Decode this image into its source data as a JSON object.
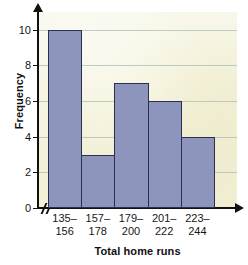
{
  "chart_data": {
    "type": "bar",
    "title": "",
    "xlabel": "Total home runs",
    "ylabel": "Frequency",
    "categories": [
      "135–156",
      "157–178",
      "179–200",
      "201–222",
      "223–244"
    ],
    "category_lines": [
      [
        "135–",
        "156"
      ],
      [
        "157–",
        "178"
      ],
      [
        "179–",
        "200"
      ],
      [
        "201–",
        "222"
      ],
      [
        "223–",
        "244"
      ]
    ],
    "values": [
      10,
      3,
      7,
      6,
      4
    ],
    "ylim": [
      0,
      11
    ],
    "yticks": [
      0,
      2,
      4,
      6,
      8,
      10
    ],
    "ytick_labels": [
      "0",
      "2",
      "4",
      "6",
      "8",
      "10"
    ],
    "grid": true,
    "grid_axis": "y",
    "legend": false,
    "bar_gap": 0,
    "axis_break_x": true,
    "colors": {
      "bar_fill": "#8d95bd",
      "bar_border": "#2c3050",
      "plot_background": "#f2f0d7",
      "page_background": "#ffffff",
      "gridline": "#a8bcb6",
      "axis": "#111111",
      "text": "#161616"
    }
  }
}
